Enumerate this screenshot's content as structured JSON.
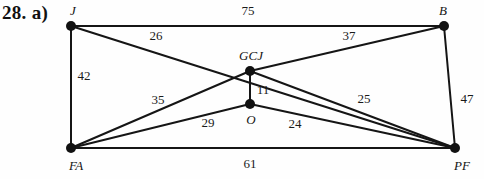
{
  "figure": {
    "problem_label": "28. a)",
    "problem_label_x": 2,
    "problem_label_y": 2,
    "width": 484,
    "height": 179,
    "background_color": "#fefefe",
    "stroke_color": "#151515",
    "node_fill_color": "#111111"
  },
  "chart_data": {
    "type": "diagram",
    "subtype": "weighted-undirected-graph",
    "title": "28. a)",
    "nodes": [
      {
        "id": "J",
        "label": "J",
        "x": 71,
        "y": 26,
        "label_x": 73,
        "label_y": 11,
        "radius": 5.0
      },
      {
        "id": "B",
        "label": "B",
        "x": 444,
        "y": 26,
        "label_x": 443,
        "label_y": 11,
        "radius": 5.0
      },
      {
        "id": "GCJ",
        "label": "GCJ",
        "x": 250,
        "y": 71,
        "label_x": 251,
        "label_y": 56,
        "radius": 5.0
      },
      {
        "id": "O",
        "label": "O",
        "x": 250,
        "y": 104,
        "label_x": 251,
        "label_y": 120,
        "radius": 5.0
      },
      {
        "id": "FA",
        "label": "FA",
        "x": 71,
        "y": 148,
        "label_x": 76,
        "label_y": 166,
        "radius": 5.0
      },
      {
        "id": "PF",
        "label": "PF",
        "x": 455,
        "y": 148,
        "label_x": 462,
        "label_y": 166,
        "radius": 5.0
      }
    ],
    "edges": [
      {
        "from": "J",
        "to": "B",
        "weight": 75,
        "label": "75",
        "label_x": 248,
        "label_y": 11
      },
      {
        "from": "J",
        "to": "PF",
        "weight": 26,
        "label": "26",
        "label_x": 156,
        "label_y": 36
      },
      {
        "from": "J",
        "to": "FA",
        "weight": 42,
        "label": "42",
        "label_x": 84,
        "label_y": 76
      },
      {
        "from": "GCJ",
        "to": "B",
        "weight": 37,
        "label": "37",
        "label_x": 349,
        "label_y": 36
      },
      {
        "from": "GCJ",
        "to": "O",
        "weight": 11,
        "label": "11",
        "label_x": 263,
        "label_y": 90
      },
      {
        "from": "FA",
        "to": "GCJ",
        "weight": 35,
        "label": "35",
        "label_x": 158,
        "label_y": 100
      },
      {
        "from": "FA",
        "to": "O",
        "weight": 29,
        "label": "29",
        "label_x": 208,
        "label_y": 123
      },
      {
        "from": "O",
        "to": "PF",
        "weight": 24,
        "label": "24",
        "label_x": 295,
        "label_y": 124
      },
      {
        "from": "GCJ",
        "to": "PF",
        "weight": 25,
        "label": "25",
        "label_x": 364,
        "label_y": 99
      },
      {
        "from": "B",
        "to": "PF",
        "weight": 47,
        "label": "47",
        "label_x": 467,
        "label_y": 99
      },
      {
        "from": "FA",
        "to": "PF",
        "weight": 61,
        "label": "61",
        "label_x": 250,
        "label_y": 164
      }
    ],
    "xlabel": "",
    "ylabel": "",
    "legend": []
  }
}
